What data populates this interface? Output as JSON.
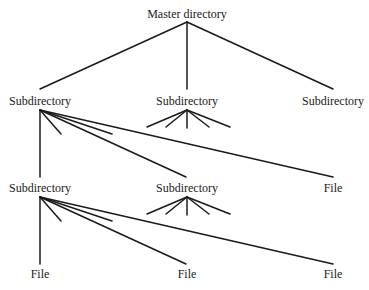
{
  "diagram": {
    "type": "tree",
    "colors": {
      "stroke": "#1a1a1a",
      "text": "#1a1a1a",
      "background": "#ffffff"
    },
    "nodes": {
      "root": {
        "label": "Master directory",
        "x": 187,
        "y": 18
      },
      "l1_left": {
        "label": "Subdirectory",
        "x": 40,
        "y": 105
      },
      "l1_mid": {
        "label": "Subdirectory",
        "x": 187,
        "y": 105
      },
      "l1_right": {
        "label": "Subdirectory",
        "x": 333,
        "y": 105
      },
      "l2_left": {
        "label": "Subdirectory",
        "x": 40,
        "y": 192
      },
      "l2_mid": {
        "label": "Subdirectory",
        "x": 187,
        "y": 192
      },
      "l2_right": {
        "label": "File",
        "x": 333,
        "y": 192
      },
      "l3_left": {
        "label": "File",
        "x": 40,
        "y": 278
      },
      "l3_mid": {
        "label": "File",
        "x": 187,
        "y": 278
      },
      "l3_right": {
        "label": "File",
        "x": 333,
        "y": 278
      }
    },
    "edges": [
      {
        "from": "root",
        "to": "l1_left"
      },
      {
        "from": "root",
        "to": "l1_mid"
      },
      {
        "from": "root",
        "to": "l1_right"
      },
      {
        "from": "l1_left",
        "to": "l2_left"
      },
      {
        "from": "l1_left",
        "to": "l2_mid"
      },
      {
        "from": "l1_left",
        "to": "l2_right"
      },
      {
        "from": "l2_left",
        "to": "l3_left"
      },
      {
        "from": "l2_left",
        "to": "l3_mid"
      },
      {
        "from": "l2_left",
        "to": "l3_right"
      }
    ],
    "elided_branches": [
      {
        "parent": "l1_left",
        "count": 2,
        "note": "short stub lines indicating additional children"
      },
      {
        "parent": "l1_mid",
        "count": 5,
        "note": "fan of stub lines indicating children"
      },
      {
        "parent": "l2_left",
        "count": 2,
        "note": "short stub lines indicating additional children"
      },
      {
        "parent": "l2_mid",
        "count": 5,
        "note": "fan of stub lines indicating children"
      }
    ]
  }
}
